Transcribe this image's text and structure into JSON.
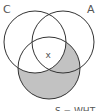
{
  "diagram": {
    "type": "venn",
    "sets": [
      {
        "label": "C",
        "cx": 35,
        "cy": 42,
        "r": 31
      },
      {
        "label": "A",
        "cx": 63,
        "cy": 42,
        "r": 31
      },
      {
        "label": "",
        "cx": 49,
        "cy": 68,
        "r": 31
      }
    ],
    "shaded_region": "bottom circle excluding circle C",
    "center_mark": "x",
    "caption": "S = WHT",
    "colors": {
      "outline": "#333333",
      "shade": "#c2c2c2",
      "background": "#ffffff",
      "label": "#555555"
    }
  }
}
